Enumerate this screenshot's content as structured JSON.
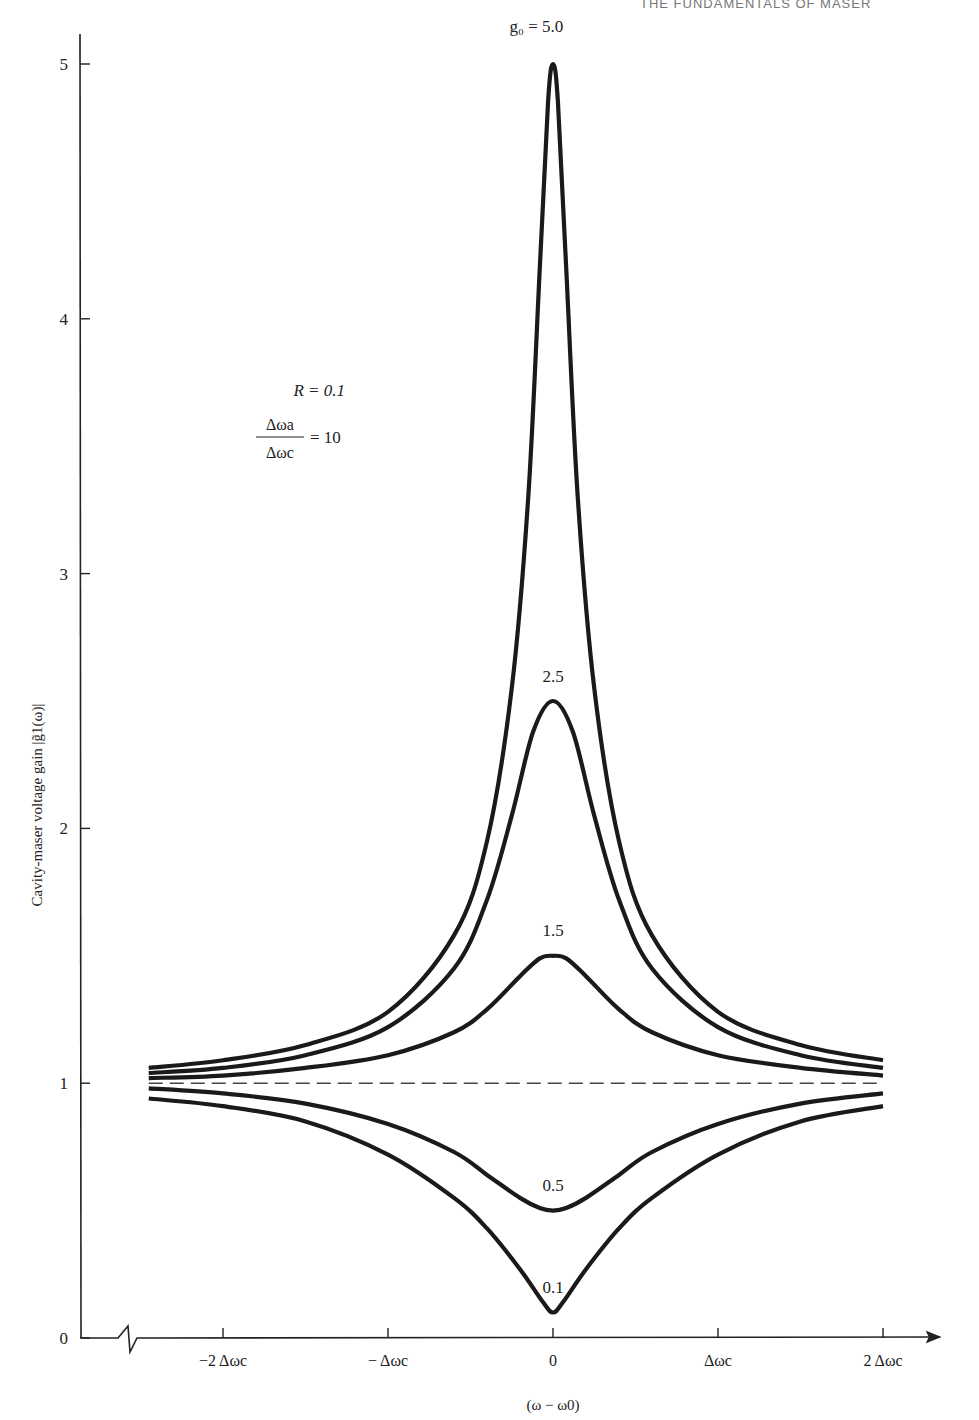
{
  "page": {
    "running_head": "THE FUNDAMENTALS OF MASER"
  },
  "chart_data": {
    "type": "line",
    "title": "",
    "xlabel": "(ω − ω0)",
    "ylabel": "Cavity-maser voltage gain |g̃1(ω)|",
    "x_unit": "Δωc",
    "x_ticks": [
      {
        "value": -2,
        "label": "−2 Δωc"
      },
      {
        "value": -1,
        "label": "− Δωc"
      },
      {
        "value": 0,
        "label": "0"
      },
      {
        "value": 1,
        "label": "Δωc"
      },
      {
        "value": 2,
        "label": "2 Δωc"
      }
    ],
    "y_ticks": [
      0,
      1,
      2,
      3,
      4,
      5
    ],
    "xlim": [
      -2.85,
      2.05
    ],
    "ylim": [
      0,
      5.15
    ],
    "axis_break_on_x": true,
    "grid": false,
    "parameters": {
      "R": "R = 0.1",
      "ratio_numerator": "Δωa",
      "ratio_denominator": "Δωc",
      "ratio_value": "= 10"
    },
    "series": [
      {
        "name": "g0 = 5.0",
        "label": "g₀ = 5.0",
        "peak": 5.0,
        "x": [
          -2.45,
          -2.0,
          -1.5,
          -1.0,
          -0.6,
          -0.4,
          -0.25,
          -0.15,
          -0.08,
          -0.03,
          0.0,
          0.03,
          0.08,
          0.15,
          0.25,
          0.4,
          0.6,
          1.0,
          1.5,
          2.0
        ],
        "y": [
          1.06,
          1.09,
          1.15,
          1.28,
          1.58,
          1.95,
          2.55,
          3.3,
          4.2,
          4.85,
          5.0,
          4.85,
          4.2,
          3.3,
          2.55,
          1.95,
          1.58,
          1.28,
          1.15,
          1.09
        ]
      },
      {
        "name": "g0 = 2.5",
        "label": "2.5",
        "peak": 2.5,
        "x": [
          -2.45,
          -2.0,
          -1.5,
          -1.0,
          -0.6,
          -0.4,
          -0.25,
          -0.12,
          0.0,
          0.12,
          0.25,
          0.4,
          0.6,
          1.0,
          1.5,
          2.0
        ],
        "y": [
          1.04,
          1.06,
          1.11,
          1.22,
          1.45,
          1.72,
          2.05,
          2.38,
          2.5,
          2.38,
          2.05,
          1.72,
          1.45,
          1.22,
          1.11,
          1.06
        ]
      },
      {
        "name": "g0 = 1.5",
        "label": "1.5",
        "peak": 1.5,
        "x": [
          -2.45,
          -2.0,
          -1.5,
          -1.0,
          -0.6,
          -0.4,
          -0.2,
          -0.08,
          0.0,
          0.08,
          0.2,
          0.4,
          0.6,
          1.0,
          1.5,
          2.0
        ],
        "y": [
          1.02,
          1.03,
          1.06,
          1.11,
          1.2,
          1.29,
          1.42,
          1.49,
          1.5,
          1.49,
          1.42,
          1.29,
          1.2,
          1.11,
          1.06,
          1.03
        ]
      },
      {
        "name": "reference g = 1 (dashed)",
        "label": "",
        "style": "dashed",
        "x": [
          -2.45,
          2.0
        ],
        "y": [
          1.0,
          1.0
        ]
      },
      {
        "name": "g0 = 0.5",
        "label": "0.5",
        "peak": 0.5,
        "x": [
          -2.45,
          -2.0,
          -1.5,
          -1.0,
          -0.6,
          -0.4,
          -0.2,
          -0.08,
          0.0,
          0.08,
          0.2,
          0.4,
          0.6,
          1.0,
          1.5,
          2.0
        ],
        "y": [
          0.98,
          0.96,
          0.92,
          0.84,
          0.73,
          0.64,
          0.55,
          0.51,
          0.5,
          0.51,
          0.55,
          0.64,
          0.73,
          0.84,
          0.92,
          0.96
        ]
      },
      {
        "name": "g0 = 0.1",
        "label": "0.1",
        "peak": 0.1,
        "x": [
          -2.45,
          -2.0,
          -1.5,
          -1.0,
          -0.6,
          -0.4,
          -0.2,
          -0.06,
          0.0,
          0.06,
          0.2,
          0.4,
          0.6,
          1.0,
          1.5,
          2.0
        ],
        "y": [
          0.94,
          0.91,
          0.85,
          0.72,
          0.55,
          0.43,
          0.27,
          0.14,
          0.1,
          0.14,
          0.27,
          0.43,
          0.55,
          0.72,
          0.85,
          0.91
        ]
      }
    ],
    "annotations": [
      {
        "text": "g₀ = 5.0",
        "x": -0.1,
        "y": 5.15
      },
      {
        "text": "2.5",
        "x": 0.0,
        "y": 2.6
      },
      {
        "text": "1.5",
        "x": 0.0,
        "y": 1.6
      },
      {
        "text": "0.5",
        "x": 0.0,
        "y": 0.6
      },
      {
        "text": "0.1",
        "x": 0.0,
        "y": 0.2
      }
    ]
  }
}
